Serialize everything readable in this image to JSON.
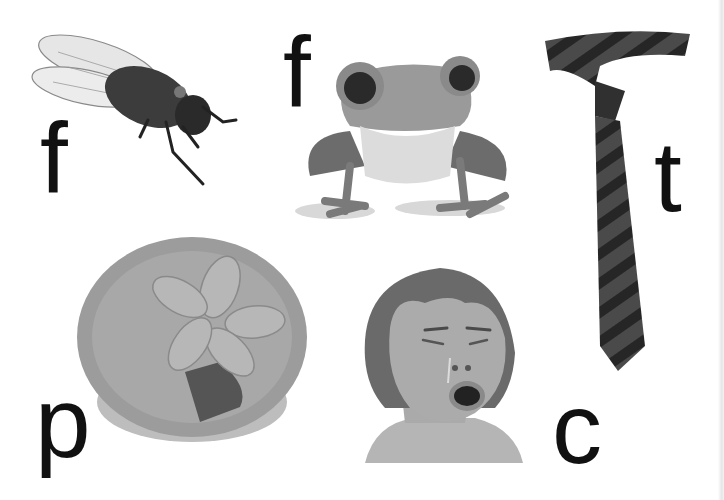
{
  "worksheet": {
    "items": [
      {
        "picture": "fly",
        "letter": "f"
      },
      {
        "picture": "frog",
        "letter": "f"
      },
      {
        "picture": "tie",
        "letter": "t"
      },
      {
        "picture": "pie",
        "letter": "p"
      },
      {
        "picture": "crying-child",
        "letter": "c"
      }
    ],
    "colors": {
      "background": "#ffffff",
      "letter": "#111111",
      "tie_dark": "#2a2a2a",
      "tie_stripe": "#4a4a4a",
      "skin": "#a9a9a9",
      "hair": "#6a6a6a"
    }
  }
}
